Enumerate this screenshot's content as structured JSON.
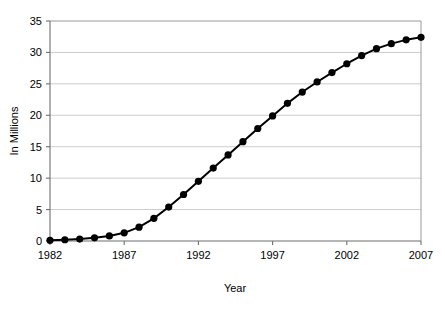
{
  "chart_data": {
    "type": "line",
    "title": "",
    "xlabel": "Year",
    "ylabel": "In Millions",
    "xlim": [
      1982,
      2007
    ],
    "ylim": [
      0,
      35
    ],
    "grid": true,
    "legend": "none",
    "x_ticks": [
      "1982",
      "1987",
      "1992",
      "1997",
      "2002",
      "2007"
    ],
    "x_tick_values": [
      1982,
      1987,
      1992,
      1997,
      2002,
      2007
    ],
    "y_ticks": [
      "0",
      "5",
      "10",
      "15",
      "20",
      "25",
      "30",
      "35"
    ],
    "y_tick_values": [
      0,
      5,
      10,
      15,
      20,
      25,
      30,
      35
    ],
    "x": [
      1982,
      1983,
      1984,
      1985,
      1986,
      1987,
      1988,
      1989,
      1990,
      1991,
      1992,
      1993,
      1994,
      1995,
      1996,
      1997,
      1998,
      1999,
      2000,
      2001,
      2002,
      2003,
      2004,
      2005,
      2006,
      2007
    ],
    "values": [
      0.1,
      0.2,
      0.3,
      0.5,
      0.8,
      1.3,
      2.2,
      3.6,
      5.4,
      7.4,
      9.5,
      11.6,
      13.7,
      15.8,
      17.9,
      19.9,
      21.9,
      23.7,
      25.3,
      26.8,
      28.2,
      29.5,
      30.6,
      31.4,
      32.0,
      32.4
    ],
    "series": [
      {
        "name": "In Millions",
        "color": "#000000",
        "marker": "circle",
        "values": [
          0.1,
          0.2,
          0.3,
          0.5,
          0.8,
          1.3,
          2.2,
          3.6,
          5.4,
          7.4,
          9.5,
          11.6,
          13.7,
          15.8,
          17.9,
          19.9,
          21.9,
          23.7,
          25.3,
          26.8,
          28.2,
          29.5,
          30.6,
          31.4,
          32.0,
          32.4
        ]
      }
    ]
  },
  "axis_titles": {
    "x": "Year",
    "y": "In Millions"
  }
}
